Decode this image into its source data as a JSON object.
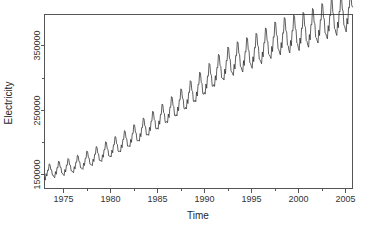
{
  "figure": {
    "background_color": "#ffffff",
    "line_color": "#2b2b2b",
    "axis_color": "#555555"
  },
  "chart_data": {
    "type": "line",
    "title": "",
    "subtitle": "",
    "xlabel": "Time",
    "ylabel": "Electricity",
    "grid": false,
    "legend": false,
    "xlim": [
      1973.0,
      2005.75
    ],
    "ylim": [
      128000,
      398000
    ],
    "xticks": [
      1975,
      1980,
      1985,
      1990,
      1995,
      2000,
      2005
    ],
    "xticklabels": [
      "1975",
      "1980",
      "1985",
      "1990",
      "1995",
      "2000",
      "2005"
    ],
    "xminorticks": [
      1977.5,
      1982.5,
      1987.5,
      1992.5,
      1997.5,
      2002.5
    ],
    "yticks": [
      150000,
      250000,
      350000
    ],
    "yticklabels": [
      "150000",
      "250000",
      "350000"
    ],
    "yminorticks": [
      200000,
      300000
    ],
    "series": [
      {
        "name": "Electricity",
        "x_start": 1973.0,
        "x_step": 0.08333,
        "values": [
          144014,
          141010,
          150950,
          147380,
          156700,
          156000,
          166200,
          165100,
          157300,
          157100,
          148900,
          148800,
          146200,
          144700,
          154200,
          150100,
          160600,
          160000,
          170500,
          169100,
          161000,
          160700,
          152000,
          151600,
          149400,
          148000,
          157400,
          153700,
          164300,
          163900,
          174500,
          173300,
          164800,
          164300,
          155600,
          155200,
          153600,
          152300,
          161900,
          158400,
          169000,
          168800,
          179800,
          178600,
          169900,
          169300,
          160200,
          159800,
          158900,
          157700,
          167400,
          163800,
          174900,
          174600,
          186200,
          185100,
          176000,
          175200,
          165800,
          165200,
          164800,
          163500,
          173600,
          169900,
          181300,
          181000,
          193100,
          192000,
          182600,
          181700,
          171800,
          171300,
          171300,
          169900,
          180300,
          176400,
          188300,
          188000,
          200600,
          199500,
          189800,
          188800,
          178500,
          178000,
          178500,
          176900,
          187600,
          183400,
          195700,
          195500,
          208700,
          207600,
          197600,
          196400,
          185700,
          185200,
          186200,
          184600,
          195700,
          191300,
          204200,
          204000,
          217700,
          216600,
          206300,
          205000,
          193800,
          193300,
          194500,
          192800,
          204200,
          199600,
          213200,
          213000,
          227300,
          226200,
          215500,
          214100,
          202400,
          201900,
          203200,
          201400,
          213300,
          208400,
          222600,
          222400,
          237300,
          236200,
          225100,
          223600,
          211400,
          210800,
          212400,
          210500,
          222900,
          217800,
          232600,
          232400,
          247900,
          246700,
          235300,
          233700,
          220900,
          220300,
          222100,
          220100,
          233000,
          227700,
          243100,
          242800,
          259000,
          257700,
          245900,
          244200,
          230800,
          230200,
          232200,
          230100,
          243600,
          238000,
          254100,
          253800,
          270600,
          269300,
          256900,
          255100,
          241200,
          240500,
          242700,
          240500,
          254500,
          248700,
          265500,
          265100,
          282700,
          281300,
          268400,
          266500,
          252000,
          251300,
          253700,
          251400,
          266000,
          259900,
          277400,
          277000,
          295300,
          293900,
          280400,
          278400,
          263300,
          262500,
          265100,
          262700,
          277900,
          271600,
          289800,
          289400,
          308500,
          307000,
          292900,
          290800,
          275100,
          274200,
          277000,
          274400,
          290200,
          283600,
          302600,
          302100,
          322100,
          320500,
          305800,
          303600,
          287200,
          286300,
          289200,
          286500,
          303000,
          296100,
          315900,
          315400,
          336200,
          334500,
          319200,
          316900,
          299800,
          298800,
          299100,
          296300,
          313300,
          306200,
          326600,
          326100,
          347600,
          345900,
          330100,
          327700,
          310100,
          309000,
          306200,
          303400,
          320700,
          313400,
          334400,
          333800,
          355800,
          354100,
          337900,
          335500,
          317400,
          316300,
          311600,
          308800,
          326400,
          319000,
          340400,
          339800,
          362200,
          360400,
          343900,
          341400,
          323000,
          321900,
          317400,
          314500,
          332400,
          324900,
          346700,
          346100,
          368900,
          367100,
          350200,
          347700,
          328900,
          327800,
          324600,
          321600,
          339900,
          332200,
          354500,
          353900,
          377200,
          375400,
          358100,
          355500,
          336300,
          335200,
          332700,
          329700,
          348400,
          340500,
          363300,
          362700,
          386500,
          384700,
          367000,
          364300,
          344700,
          343600,
          338400,
          335300,
          354400,
          346300,
          369600,
          369000,
          393300,
          391400,
          373300,
          370600,
          350600,
          349400,
          341500,
          338400,
          357700,
          349500,
          373000,
          372400,
          397000,
          395100,
          376700,
          374000,
          353700,
          352500,
          345200,
          342000,
          361500,
          353200,
          377000,
          376300,
          401300,
          399300,
          380700,
          377900,
          357300,
          356100,
          350400,
          347200,
          367000,
          358600,
          382700,
          382000,
          407400,
          405400,
          386400,
          383600,
          362600,
          361400,
          357100,
          353800,
          373900,
          365400,
          389900,
          389200,
          415000,
          412900,
          393600,
          390700,
          369300,
          368100,
          363600,
          360300,
          380700,
          372100,
          397000,
          396300,
          422500,
          420400,
          400700,
          397800,
          376100,
          374800,
          368900,
          365500,
          386200,
          377500,
          402800,
          402100,
          428600,
          426500,
          406500,
          403500,
          381500,
          380200,
          374500,
          371000,
          392000,
          383200,
          408900,
          408200,
          435100,
          432900,
          412700,
          409600
        ]
      }
    ]
  },
  "axes": {
    "x_axis_title": "Time",
    "y_axis_title": "Electricity"
  }
}
